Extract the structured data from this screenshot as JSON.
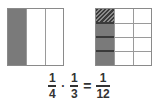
{
  "diagram": {
    "left_model": {
      "description": "Rectangle divided into 3 equal vertical columns; 1 column shaded",
      "columns": 3,
      "rows": 1,
      "shaded_columns": [
        0
      ],
      "fill_color": "#7a7a7a",
      "border_color": "#8a8a8a"
    },
    "right_model": {
      "description": "Rectangle divided into 3 columns by 4 rows; first column shaded, top-left cell hatched",
      "columns": 3,
      "rows": 4,
      "shaded_columns": [
        0
      ],
      "hatched_cells": [
        [
          0,
          0
        ]
      ],
      "fill_color": "#7a7a7a",
      "hatch_color": "#3a3a3a",
      "border_color": "#8a8a8a"
    },
    "equation": {
      "frac1": {
        "numerator": "1",
        "denominator": "4"
      },
      "operator": "·",
      "frac2": {
        "numerator": "1",
        "denominator": "3"
      },
      "equals": "=",
      "result": {
        "numerator": "1",
        "denominator": "12"
      },
      "text_color": "#333333"
    }
  }
}
